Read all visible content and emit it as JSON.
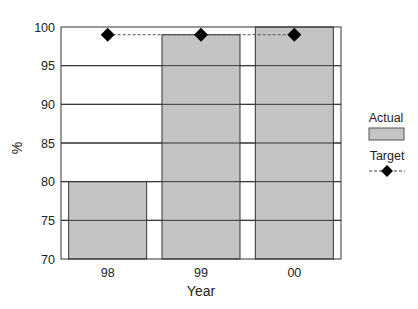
{
  "chart_data": {
    "type": "bar",
    "title": "",
    "xlabel": "Year",
    "ylabel": "%",
    "categories": [
      "98",
      "99",
      "00"
    ],
    "ylim": [
      70,
      100
    ],
    "yticks": [
      70,
      75,
      80,
      85,
      90,
      95,
      100
    ],
    "grid": "horizontal",
    "legend_position": "right",
    "series": [
      {
        "name": "Actual",
        "type": "bar",
        "values": [
          80,
          99,
          100
        ],
        "color": "#c4c4c4"
      },
      {
        "name": "Target",
        "type": "line",
        "marker": "diamond",
        "linestyle": "dashed",
        "values": [
          99,
          99,
          99
        ],
        "color": "#000000"
      }
    ]
  },
  "legend": {
    "actual_label": "Actual",
    "target_label": "Target"
  },
  "axes": {
    "xlabel": "Year",
    "ylabel": "%"
  }
}
